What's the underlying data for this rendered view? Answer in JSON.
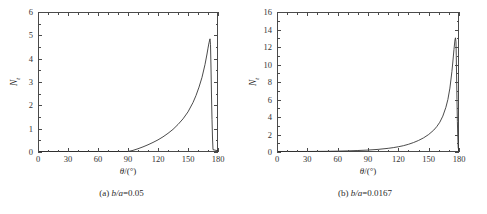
{
  "figure": {
    "panels": [
      {
        "caption_index": "(a)",
        "caption_var": "b/a",
        "caption_eq": "=",
        "caption_value": "0.05",
        "caption_full": "(a) b/a=0.05"
      },
      {
        "caption_index": "(b)",
        "caption_var": "b/a",
        "caption_eq": "=",
        "caption_value": "0.0167",
        "caption_full": "(b) b/a=0.0167"
      }
    ]
  },
  "chart_data": [
    {
      "type": "line",
      "title": "(a) b/a=0.05",
      "xlabel": "θ/(°)",
      "ylabel": "N",
      "ylabel_sub": "t",
      "xlim": [
        0,
        180
      ],
      "ylim": [
        0,
        6
      ],
      "xticks": [
        0,
        30,
        60,
        90,
        120,
        150,
        180
      ],
      "xtick_labels": [
        "0",
        "30",
        "60",
        "90",
        "120",
        "150",
        "180"
      ],
      "yticks": [
        0,
        1,
        2,
        3,
        4,
        5,
        6
      ],
      "ytick_labels": [
        "0",
        "1",
        "2",
        "3",
        "4",
        "5",
        "6"
      ],
      "x_minor_interval": 10,
      "y_minor_interval": 0.5,
      "grid": false,
      "legend": null,
      "series": [
        {
          "name": "N_t",
          "color": "#2b2b2b",
          "x": [
            0,
            10,
            20,
            30,
            40,
            50,
            60,
            70,
            80,
            90,
            95,
            100,
            105,
            110,
            115,
            120,
            125,
            130,
            135,
            140,
            145,
            150,
            155,
            158,
            161,
            164,
            167,
            169,
            170,
            171,
            172,
            172.5,
            173,
            173.5,
            174,
            174.5,
            175,
            180
          ],
          "y": [
            0.02,
            0.02,
            0.02,
            0.02,
            0.02,
            0.02,
            0.02,
            0.02,
            0.02,
            0.02,
            0.07,
            0.14,
            0.22,
            0.31,
            0.41,
            0.52,
            0.65,
            0.8,
            0.97,
            1.18,
            1.42,
            1.72,
            2.12,
            2.42,
            2.78,
            3.2,
            3.75,
            4.2,
            4.45,
            4.68,
            4.85,
            4.6,
            3.6,
            2.4,
            1.4,
            0.6,
            0.1,
            0.05
          ]
        }
      ]
    },
    {
      "type": "line",
      "title": "(b) b/a=0.0167",
      "xlabel": "θ/(°)",
      "ylabel": "N",
      "ylabel_sub": "t",
      "xlim": [
        0,
        180
      ],
      "ylim": [
        0,
        16
      ],
      "xticks": [
        0,
        30,
        60,
        90,
        120,
        150,
        180
      ],
      "xtick_labels": [
        "0",
        "30",
        "60",
        "90",
        "120",
        "150",
        "180"
      ],
      "yticks": [
        0,
        2,
        4,
        6,
        8,
        10,
        12,
        14,
        16
      ],
      "ytick_labels": [
        "0",
        "2",
        "4",
        "6",
        "8",
        "10",
        "12",
        "14",
        "16"
      ],
      "x_minor_interval": 10,
      "y_minor_interval": 1,
      "grid": false,
      "legend": null,
      "series": [
        {
          "name": "N_t",
          "color": "#2b2b2b",
          "x": [
            0,
            10,
            20,
            30,
            40,
            50,
            60,
            70,
            80,
            90,
            100,
            110,
            115,
            120,
            125,
            130,
            135,
            140,
            145,
            150,
            155,
            158,
            161,
            164,
            167,
            169,
            171,
            173,
            174,
            175,
            176,
            176.5,
            177,
            177.3,
            177.6,
            178,
            178.4,
            178.8,
            179.2,
            180
          ],
          "y": [
            0.06,
            0.06,
            0.06,
            0.06,
            0.07,
            0.08,
            0.1,
            0.13,
            0.17,
            0.22,
            0.3,
            0.42,
            0.5,
            0.6,
            0.72,
            0.88,
            1.08,
            1.32,
            1.62,
            2.0,
            2.5,
            2.9,
            3.4,
            4.1,
            5.1,
            6.0,
            7.3,
            9.2,
            10.4,
            11.7,
            12.8,
            13.05,
            12.6,
            11.0,
            8.8,
            6.0,
            3.5,
            1.7,
            0.5,
            0.1
          ]
        }
      ]
    }
  ]
}
